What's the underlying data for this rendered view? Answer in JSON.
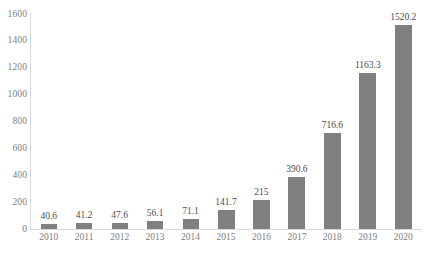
{
  "chart_data": {
    "type": "bar",
    "title": "",
    "subtitle": "",
    "xlabel": "",
    "ylabel": "",
    "categories": [
      "2010",
      "2011",
      "2012",
      "2013",
      "2014",
      "2015",
      "2016",
      "2017",
      "2018",
      "2019",
      "2020"
    ],
    "values": [
      40.6,
      41.2,
      47.6,
      56.1,
      71.1,
      141.7,
      215,
      390.6,
      716.6,
      1163.3,
      1520.2
    ],
    "value_labels": [
      "40.6",
      "41.2",
      "47.6",
      "56.1",
      "71.1",
      "141.7",
      "215",
      "390.6",
      "716.6",
      "1163.3",
      "1520.2"
    ],
    "ylim": [
      0,
      1600
    ],
    "y_ticks": [
      0,
      200,
      400,
      600,
      800,
      1000,
      1200,
      1400,
      1600
    ],
    "y_tick_labels": [
      "0",
      "200",
      "400",
      "600",
      "800",
      "1000",
      "1200",
      "1400",
      "1600"
    ],
    "grid": false,
    "legend": false,
    "legend_position": "none",
    "bar_color": "#7f7f7f",
    "axis_color": "#d9d9d9",
    "tick_label_color": "#808080",
    "value_label_color": "#4d4d4d"
  }
}
